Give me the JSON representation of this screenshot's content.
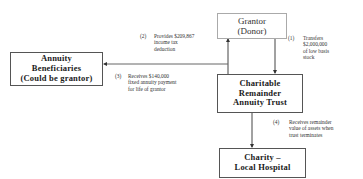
{
  "diagram": {
    "nodes": {
      "grantor": {
        "lines": [
          "Grantor",
          "(Donor)"
        ]
      },
      "annuity_beneficiaries": {
        "lines": [
          "Annuity",
          "Beneficiaries",
          "(Could be grantor)"
        ]
      },
      "crat": {
        "lines": [
          "Charitable",
          "Remainder",
          "Annuity Trust"
        ]
      },
      "charity": {
        "lines": [
          "Charity –",
          "Local Hospital"
        ]
      }
    },
    "annotations": {
      "step1": {
        "number": "(1)",
        "lines": [
          "Transfers",
          "$2,000,000",
          "of low basis",
          "stock"
        ]
      },
      "step2": {
        "number": "(2)",
        "lines": [
          "Provides $209,867",
          "income tax",
          "deduction"
        ]
      },
      "step3": {
        "number": "(3)",
        "lines": [
          "Receives $140,000",
          "fixed annuity payment",
          "for life of grantor"
        ]
      },
      "step4": {
        "number": "(4)",
        "lines": [
          "Receives remainder",
          "value of assets when",
          "trust terminates"
        ]
      }
    },
    "edges": [
      {
        "from": "grantor",
        "to": "crat",
        "label": "step1"
      },
      {
        "from": "crat",
        "to": "grantor",
        "label": "step2"
      },
      {
        "from": "crat",
        "to": "annuity_beneficiaries",
        "label": "step3"
      },
      {
        "from": "crat",
        "to": "charity",
        "label": "step4"
      }
    ],
    "colors": {
      "line": "#444444",
      "box_border": "#555555",
      "grantor_border": "#aaaaaa",
      "text": "#1a1a1a"
    }
  }
}
